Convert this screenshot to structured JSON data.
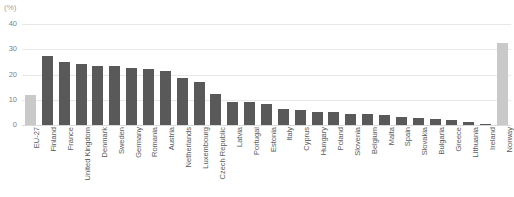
{
  "chart_data": {
    "type": "bar",
    "title": "",
    "subtitle": "",
    "unit_label": "(%)",
    "xlabel": "",
    "ylabel": "",
    "ylim": [
      0,
      40
    ],
    "yticks": [
      0,
      10,
      20,
      30,
      40
    ],
    "ytick_labels": [
      "0",
      "10",
      "20",
      "30",
      "40"
    ],
    "grid": true,
    "legend": "none",
    "legend_entries": [],
    "annotations": [],
    "colors": {
      "bar_default": "#595959",
      "bar_highlight": "#c9c9c9",
      "gridline": "#e8e8e8",
      "axis": "#d9d9d9",
      "tick_text": "#808080",
      "label_text": "#595959",
      "unit_text": "#a6a6a6",
      "background": "#ffffff"
    },
    "categories": [
      "EU-27",
      "Finland",
      "France",
      "United Kingdom",
      "Denmark",
      "Sweden",
      "Germany",
      "Romania",
      "Austria",
      "Netherlands",
      "Luxembourg",
      "Czech Republic",
      "Latvia",
      "Portugal",
      "Estonia",
      "Italy",
      "Cyprus",
      "Hungary",
      "Poland",
      "Slovenia",
      "Belgium",
      "Malta",
      "Spain",
      "Slovakia",
      "Bulgaria",
      "Greece",
      "Lithuania",
      "Ireland",
      "Norway"
    ],
    "values": [
      11.8,
      27.5,
      25.0,
      24.0,
      23.4,
      23.3,
      22.5,
      22.1,
      21.4,
      18.5,
      17.2,
      12.3,
      9.3,
      9.2,
      8.5,
      6.3,
      5.9,
      5.2,
      5.0,
      4.3,
      4.2,
      4.1,
      3.3,
      2.6,
      2.3,
      2.0,
      1.0,
      0.5,
      32.3
    ],
    "highlight_categories": [
      "EU-27",
      "Norway"
    ]
  }
}
